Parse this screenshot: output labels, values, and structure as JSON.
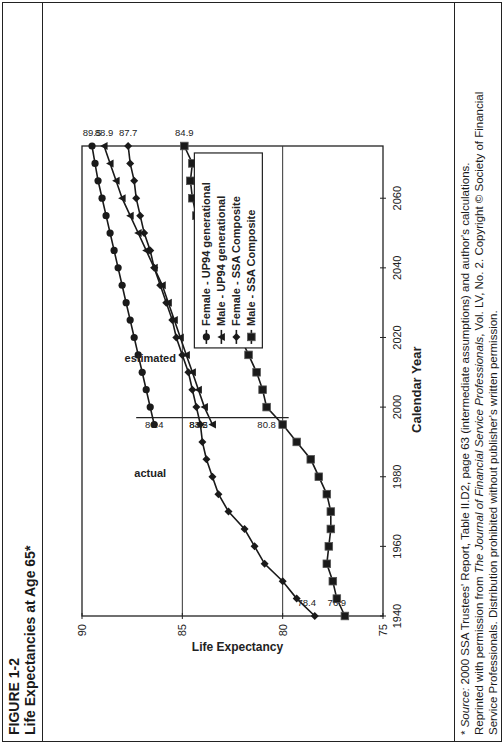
{
  "figure": {
    "label": "FIGURE 1-2",
    "title": "Life Expectancies at Age 65*"
  },
  "footer": {
    "line1_prefix": "* ",
    "line1_source_word": "Source:",
    "line1_rest": " 2000 SSA Trustees' Report, Table II.D2, page 63 (intermediate assumptions) and author's calculations.",
    "line2_prefix": "Reprinted with permission from ",
    "line2_journal": "The Journal of Financial Service Professionals",
    "line2_rest": ", Vol. LV, No. 2. Copyright © Society of Financial",
    "line3": "Service Professionals. Distribution prohibited without publisher's written permission."
  },
  "chart_data": {
    "type": "line",
    "title": "Life Expectancies at Age 65*",
    "xlabel": "Calendar Year",
    "ylabel": "Life Expectancy",
    "xlim": [
      1940,
      2075
    ],
    "ylim": [
      75,
      90
    ],
    "xticks": [
      1940,
      1960,
      1980,
      2000,
      2020,
      2040,
      2060
    ],
    "yticks": [
      75,
      80,
      85,
      90
    ],
    "grid": "horizontal at 80 and 85; vertical divider at ~1997",
    "legend_position": "upper right inside plot",
    "annotations": [
      {
        "text": "actual",
        "x": 1978,
        "y": 86.6
      },
      {
        "text": "estimated",
        "x": 2012,
        "y": 86.6
      },
      {
        "text": "86.4",
        "x": 1997,
        "series": "Female - UP94 generational"
      },
      {
        "text": "84.2",
        "x": 1997,
        "series": "Female - SSA Composite"
      },
      {
        "text": "83.5",
        "x": 1997,
        "series": "Male - UP94 generational"
      },
      {
        "text": "80.8",
        "x": 1997,
        "series": "Male - SSA Composite"
      },
      {
        "text": "89.5",
        "x": 2075,
        "series": "Female - UP94 generational"
      },
      {
        "text": "88.9",
        "x": 2075,
        "series": "Male - UP94 generational"
      },
      {
        "text": "87.7",
        "x": 2075,
        "series": "Female - SSA Composite"
      },
      {
        "text": "84.9",
        "x": 2075,
        "series": "Male - SSA Composite"
      },
      {
        "text": "78.4",
        "x": 1940,
        "series": "Female - SSA Composite"
      },
      {
        "text": "76.9",
        "x": 1940,
        "series": "Male - SSA Composite"
      }
    ],
    "series": [
      {
        "name": "Female - UP94 generational",
        "marker": "circle",
        "x": [
          1995,
          2000,
          2005,
          2010,
          2015,
          2020,
          2025,
          2030,
          2035,
          2040,
          2045,
          2050,
          2055,
          2060,
          2065,
          2070,
          2075
        ],
        "values": [
          86.4,
          86.6,
          86.8,
          87.0,
          87.2,
          87.4,
          87.6,
          87.8,
          88.0,
          88.2,
          88.4,
          88.6,
          88.8,
          89.0,
          89.2,
          89.35,
          89.5
        ]
      },
      {
        "name": "Male - UP94 generational",
        "marker": "triangle",
        "x": [
          1995,
          2000,
          2005,
          2010,
          2015,
          2020,
          2025,
          2030,
          2035,
          2040,
          2045,
          2050,
          2055,
          2060,
          2065,
          2070,
          2075
        ],
        "values": [
          83.5,
          83.9,
          84.2,
          84.5,
          84.8,
          85.1,
          85.4,
          85.7,
          86.0,
          86.4,
          86.8,
          87.2,
          87.6,
          88.0,
          88.3,
          88.6,
          88.9
        ]
      },
      {
        "name": "Female - SSA Composite",
        "marker": "diamond",
        "x": [
          1940,
          1945,
          1950,
          1955,
          1960,
          1965,
          1970,
          1975,
          1980,
          1985,
          1990,
          1995,
          2000,
          2005,
          2010,
          2015,
          2020,
          2025,
          2030,
          2035,
          2040,
          2045,
          2050,
          2055,
          2060,
          2065,
          2070,
          2075
        ],
        "values": [
          78.4,
          79.3,
          80.0,
          80.9,
          81.4,
          81.9,
          82.7,
          83.2,
          83.5,
          83.8,
          84.0,
          84.1,
          84.3,
          84.5,
          84.7,
          85.0,
          85.3,
          85.5,
          85.8,
          86.1,
          86.4,
          86.6,
          86.9,
          87.1,
          87.3,
          87.4,
          87.6,
          87.7
        ]
      },
      {
        "name": "Male - SSA Composite",
        "marker": "square",
        "x": [
          1940,
          1945,
          1950,
          1955,
          1960,
          1965,
          1970,
          1975,
          1980,
          1985,
          1990,
          1995,
          2000,
          2005,
          2010,
          2015,
          2020,
          2025,
          2030,
          2035,
          2040,
          2045,
          2050,
          2055,
          2060,
          2065,
          2070,
          2075
        ],
        "values": [
          76.9,
          77.3,
          77.5,
          77.8,
          77.7,
          77.6,
          77.6,
          77.8,
          78.2,
          78.6,
          79.3,
          80.0,
          80.8,
          81.0,
          81.3,
          81.7,
          82.1,
          82.5,
          82.8,
          83.2,
          83.5,
          83.8,
          84.1,
          84.3,
          84.5,
          84.6,
          84.5,
          84.9
        ]
      }
    ]
  }
}
